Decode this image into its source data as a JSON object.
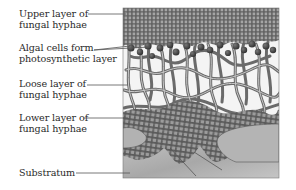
{
  "figure": {
    "labels": [
      {
        "id": "upper",
        "line1": "Upper layer of",
        "line2": "fungal hyphae"
      },
      {
        "id": "algal",
        "line1": "Algal cells form",
        "line2": "photosynthetic layer"
      },
      {
        "id": "loose",
        "line1": "Loose layer of",
        "line2": "fungal hyphae"
      },
      {
        "id": "lower",
        "line1": "Lower layer of",
        "line2": "fungal hyphae"
      },
      {
        "id": "substratum",
        "line1": "Substratum"
      }
    ]
  },
  "colors": {
    "background": "#ffffff",
    "text": "#2a2a2a",
    "leader_line": "#555555",
    "dense_layer": "#6e6e6e",
    "dense_cell": "#9a9a9a",
    "hyphae": "#888888",
    "algal_cell": "#3c3c3c",
    "substratum": "#b8b8b8"
  }
}
